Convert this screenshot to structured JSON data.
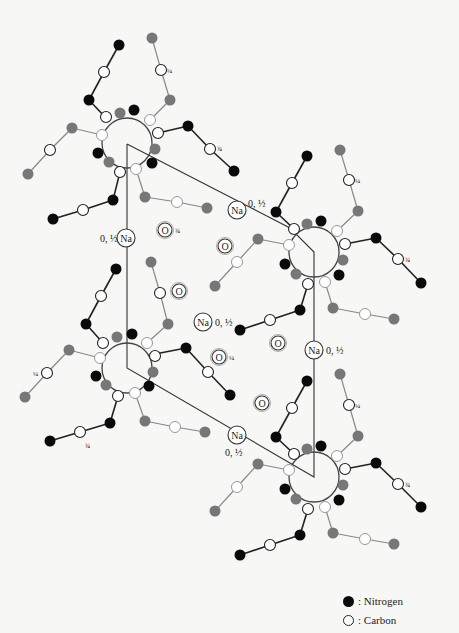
{
  "figure": {
    "title": ""
  },
  "legend": {
    "items": [
      {
        "symbol": "filled-circle",
        "label": ": Nitrogen",
        "color": "#0a0a0a"
      },
      {
        "symbol": "open-circle",
        "label": ": Carbon",
        "color": "#ffffff"
      }
    ]
  },
  "labels": {
    "na": "Na",
    "o": "O",
    "zero_half": "0, ½",
    "quarter": "¼",
    "three_quarter": "¾"
  },
  "na_ions": [
    {
      "x": 237,
      "y": 210,
      "label": "Na",
      "height_label": "0, ½",
      "label_pos": "right"
    },
    {
      "x": 126,
      "y": 238,
      "label": "Na",
      "height_label": "0, ½",
      "label_pos": "left"
    },
    {
      "x": 203,
      "y": 322,
      "label": "Na",
      "height_label": "0, ½",
      "label_pos": "right"
    },
    {
      "x": 314,
      "y": 350,
      "label": "Na",
      "height_label": "0, ½",
      "label_pos": "right"
    },
    {
      "x": 237,
      "y": 435,
      "label": "Na",
      "height_label": "0, ½",
      "label_pos": "below"
    }
  ],
  "o_atoms": [
    {
      "x": 165,
      "y": 230,
      "label": "O",
      "height_label": "¾"
    },
    {
      "x": 225,
      "y": 246,
      "label": "O",
      "height_label": ""
    },
    {
      "x": 179,
      "y": 291,
      "label": "O",
      "height_label": ""
    },
    {
      "x": 219,
      "y": 357,
      "label": "O",
      "height_label": "¼"
    },
    {
      "x": 278,
      "y": 343,
      "label": "O",
      "height_label": ""
    },
    {
      "x": 262,
      "y": 403,
      "label": "O",
      "height_label": ""
    }
  ]
}
